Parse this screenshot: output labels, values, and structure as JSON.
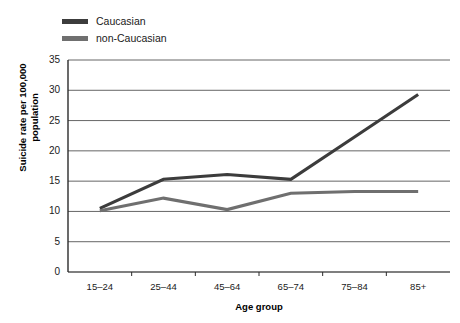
{
  "chart_data": {
    "type": "line",
    "title": "",
    "subtitle": "",
    "xlabel": "Age group",
    "ylabel": "Suicide rate per 100,000 population",
    "ylabel_line1": "Suicide rate per 100,000",
    "ylabel_line2": "population",
    "categories": [
      "15–24",
      "25–44",
      "45–64",
      "65–74",
      "75–84",
      "85+"
    ],
    "ylim": [
      0,
      35
    ],
    "yticks": [
      0,
      5,
      10,
      15,
      20,
      25,
      30,
      35
    ],
    "ytick_labels": [
      "0",
      "5",
      "10",
      "15",
      "20",
      "25",
      "30",
      "35"
    ],
    "grid": true,
    "grid_axis": "y",
    "legend_position": "top-left",
    "series": [
      {
        "name": "Caucasian",
        "color": "#3c3c3c",
        "values": [
          10.5,
          15.3,
          16.1,
          15.3,
          22.3,
          29.3
        ]
      },
      {
        "name": "non-Caucasian",
        "color": "#6f6f6f",
        "values": [
          10.1,
          12.2,
          10.3,
          13.0,
          13.3,
          13.3
        ]
      }
    ]
  },
  "legend": {
    "items": [
      {
        "label": "Caucasian",
        "color": "#3c3c3c"
      },
      {
        "label": "non-Caucasian",
        "color": "#6f6f6f"
      }
    ]
  },
  "axes": {
    "x_title": "Age group",
    "y_title_line1": "Suicide rate per 100,000",
    "y_title_line2": "population"
  },
  "colors": {
    "axis": "#2b2b2b",
    "grid": "#555555",
    "text": "#1a1a1a",
    "background": "#ffffff"
  }
}
